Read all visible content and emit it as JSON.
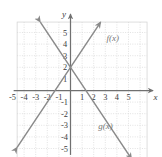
{
  "chart_data": {
    "type": "line",
    "title": "",
    "xlabel": "x",
    "ylabel": "y",
    "xlim": [
      -6,
      6
    ],
    "ylim": [
      -6,
      6
    ],
    "grid": true,
    "grid_style": "dotted",
    "legend": "inline-annotations",
    "x_ticks": [
      "-5",
      "-4",
      "-3",
      "-2",
      "-1",
      "1",
      "2",
      "3",
      "4",
      "5"
    ],
    "x_tick_values": [
      -5,
      -4,
      -3,
      -2,
      -1,
      1,
      2,
      3,
      4,
      5
    ],
    "y_ticks": [
      "5",
      "4",
      "3",
      "2",
      "1",
      "-1",
      "-2",
      "-3",
      "-4",
      "-5"
    ],
    "y_tick_values": [
      5,
      4,
      3,
      2,
      1,
      -1,
      -2,
      -3,
      -4,
      -5
    ],
    "series": [
      {
        "name": "f(x)",
        "slope": 1.5,
        "intercept": 2,
        "x": [
          -4,
          4
        ],
        "values": [
          -4,
          8
        ],
        "color": "#8a8a8a",
        "arrows": "both"
      },
      {
        "name": "g(x)",
        "slope": -1.5,
        "intercept": 2,
        "x": [
          -4,
          4
        ],
        "values": [
          8,
          -4
        ],
        "color": "#8a8a8a",
        "arrows": "both"
      }
    ],
    "intersection": [
      0,
      2
    ],
    "annotations": [
      {
        "text": "f(x)",
        "x": 3.1,
        "y": 4.3
      },
      {
        "text": "g(x)",
        "x": 2.4,
        "y": -3.3
      }
    ]
  },
  "axes": {
    "x_axis_label": "x",
    "y_axis_label": "y"
  },
  "colors": {
    "grid": "#d6d6d6",
    "axis": "#707070",
    "curve": "#8a8a8a",
    "text": "#3c3c3c"
  }
}
